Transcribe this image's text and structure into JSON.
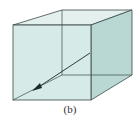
{
  "figure": {
    "caption": "(b)",
    "colors": {
      "face": "#cfe6e3",
      "face_dark": "#b9d8d4",
      "edge": "#3a4a48",
      "arrow": "#1e2a28"
    },
    "cube": {
      "front": [
        [
          13,
          25
        ],
        [
          91,
          25
        ],
        [
          91,
          100
        ],
        [
          13,
          100
        ]
      ],
      "back": [
        [
          62,
          10
        ],
        [
          132,
          10
        ],
        [
          132,
          75
        ],
        [
          62,
          75
        ]
      ]
    },
    "arrow": {
      "from": [
        90,
        53
      ],
      "to": [
        34,
        90
      ]
    }
  }
}
